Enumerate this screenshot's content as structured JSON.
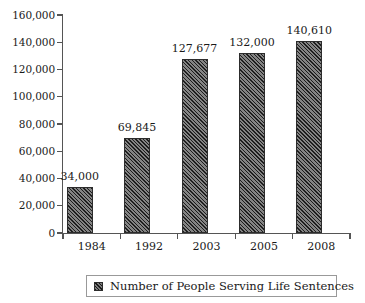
{
  "chart_data": {
    "type": "bar",
    "title": "",
    "xlabel": "",
    "ylabel": "",
    "categories": [
      "1984",
      "1992",
      "2003",
      "2005",
      "2008"
    ],
    "values": [
      34000,
      69845,
      127677,
      132000,
      140610
    ],
    "value_labels": [
      "34,000",
      "69,845",
      "127,677",
      "132,000",
      "140,610"
    ],
    "series": [
      {
        "name": "Number of People Serving Life Sentences",
        "values": [
          34000,
          69845,
          127677,
          132000,
          140610
        ]
      }
    ],
    "ylim": [
      0,
      160000
    ],
    "y_tick_values": [
      0,
      20000,
      40000,
      60000,
      80000,
      100000,
      120000,
      140000,
      160000
    ],
    "y_tick_labels": [
      "0",
      "20,000",
      "40,000",
      "60,000",
      "80,000",
      "100,000",
      "120,000",
      "140,000",
      "160,000"
    ],
    "grid": false,
    "legend_position": "bottom",
    "bar_color": "#4f4f4f",
    "bar_border_color": "#2c2c2c",
    "bar_pattern": "diagonal-hatch",
    "axis_color": "#555555",
    "background_color": "#ffffff"
  },
  "legend": {
    "entries": [
      {
        "label": "Number of People Serving Life Sentences",
        "swatch": "hatched-square-swatch"
      }
    ]
  }
}
